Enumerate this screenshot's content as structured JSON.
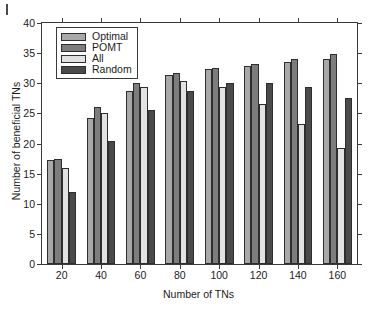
{
  "figure": {
    "background": "#ffffff",
    "axis_color": "#3a3a3a"
  },
  "chart_data": {
    "type": "bar",
    "title": "",
    "xlabel": "Number of TNs",
    "ylabel": "Number of beneficial TNs",
    "categories": [
      "20",
      "40",
      "60",
      "80",
      "100",
      "120",
      "140",
      "160"
    ],
    "ylim": [
      0,
      40
    ],
    "yticks": [
      0,
      5,
      10,
      15,
      20,
      25,
      30,
      35,
      40
    ],
    "grid": false,
    "legend_position": "upper left",
    "series": [
      {
        "name": "Optimal",
        "color": "#a8a8a8",
        "values": [
          17.3,
          24.2,
          28.7,
          31.3,
          32.3,
          32.8,
          33.5,
          34.0
        ]
      },
      {
        "name": "POMT",
        "color": "#7d7d7d",
        "values": [
          17.5,
          26.0,
          30.1,
          31.7,
          32.6,
          33.2,
          34.1,
          34.8
        ]
      },
      {
        "name": "All",
        "color": "#e2e2e2",
        "values": [
          16.0,
          25.0,
          29.3,
          30.4,
          29.4,
          26.5,
          23.3,
          19.2
        ]
      },
      {
        "name": "Random",
        "color": "#4a4a4a",
        "values": [
          11.9,
          20.4,
          25.6,
          28.7,
          30.0,
          30.0,
          29.3,
          27.6
        ]
      }
    ]
  }
}
